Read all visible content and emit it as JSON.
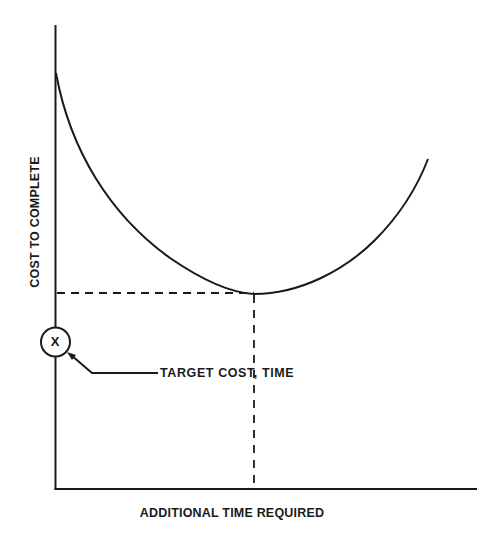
{
  "diagram": {
    "title": "",
    "x_axis_label": "ADDITIONAL TIME REQUIRED",
    "y_axis_label": "COST TO COMPLETE",
    "callout_marker": "X",
    "callout_label": "TARGET COST, TIME",
    "curve": "U-shaped cost-to-complete curve with a minimum point",
    "minimum_point_note": "Dashed guide lines project the curve minimum onto both axes",
    "colors": {
      "ink": "#1a1a1a",
      "background": "#ffffff"
    }
  }
}
